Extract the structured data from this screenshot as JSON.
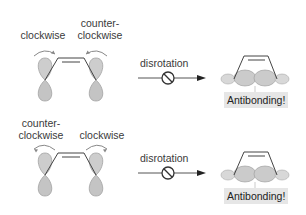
{
  "diagram": {
    "type": "orbital-rotation-scheme",
    "colors": {
      "lobe_fill": "#c9c9c9",
      "lobe_stroke": "#9a9a9a",
      "bond": "#444444",
      "arrow": "#555555",
      "tag_bg": "#e6e6e6"
    },
    "panels": [
      {
        "left_rotation_label": "clockwise",
        "right_rotation_label": "counter-\nclockwise",
        "right_label_line1": "counter-",
        "right_label_line2": "clockwise",
        "left_label_line1": "",
        "left_label_line2": "clockwise",
        "process_label": "disrotation",
        "forbidden_symbol": "⊘",
        "result_label": "Antibonding!"
      },
      {
        "left_rotation_label": "counter-\nclockwise",
        "left_label_line1": "counter-",
        "left_label_line2": "clockwise",
        "right_label_line1": "",
        "right_label_line2": "clockwise",
        "process_label": "disrotation",
        "forbidden_symbol": "⊘",
        "result_label": "Antibonding!"
      }
    ]
  }
}
